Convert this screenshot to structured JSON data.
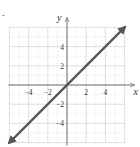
{
  "chart_data": {
    "type": "line",
    "title": "",
    "xlabel": "x",
    "ylabel": "y",
    "xlim": [
      -6,
      6
    ],
    "ylim": [
      -6,
      6
    ],
    "grid": true,
    "grid_step": 1,
    "x_ticks": [
      -4,
      -2,
      2,
      4
    ],
    "y_ticks": [
      -4,
      -2,
      2,
      4
    ],
    "x_tick_labels": [
      "−4",
      "−2",
      "2",
      "4"
    ],
    "y_tick_labels": [
      "−4",
      "−2",
      "2",
      "4"
    ],
    "series": [
      {
        "name": "y = x",
        "x": [
          -6,
          6
        ],
        "y": [
          -6,
          6
        ],
        "arrows": "both",
        "color": "#555555"
      }
    ],
    "legend": null
  },
  "marker": "."
}
